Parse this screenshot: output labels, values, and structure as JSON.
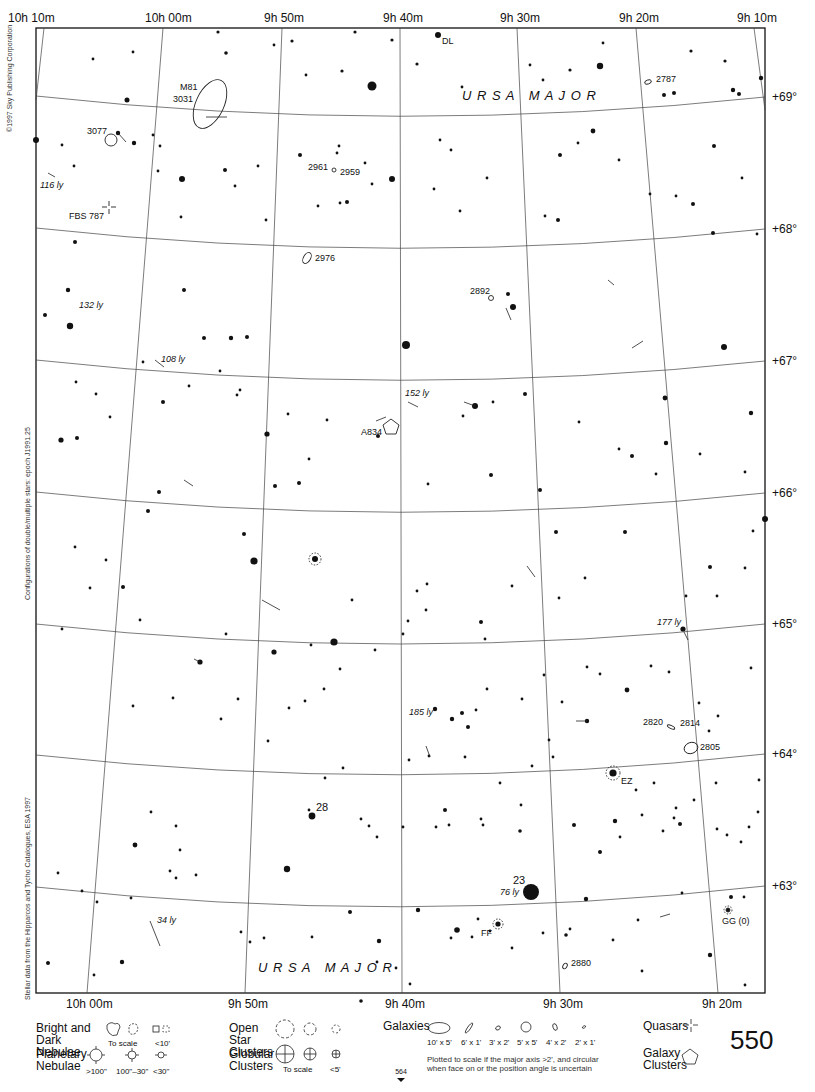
{
  "chart": {
    "constellation_labels": [
      {
        "text": "U R S A   M A J O R",
        "x": 462,
        "y": 100
      },
      {
        "text": "U R S A   M A J O R",
        "x": 258,
        "y": 972
      }
    ],
    "ra_labels_top": [
      {
        "text": "10h 10m",
        "x": 8,
        "y": 22
      },
      {
        "text": "10h 00m",
        "x": 145,
        "y": 22
      },
      {
        "text": "9h 50m",
        "x": 264,
        "y": 22
      },
      {
        "text": "9h 40m",
        "x": 383,
        "y": 22
      },
      {
        "text": "9h 30m",
        "x": 500,
        "y": 22
      },
      {
        "text": "9h 20m",
        "x": 619,
        "y": 22
      },
      {
        "text": "9h 10m",
        "x": 737,
        "y": 22
      }
    ],
    "ra_labels_bottom": [
      {
        "text": "10h 00m",
        "x": 66,
        "y": 1008
      },
      {
        "text": "9h 50m",
        "x": 228,
        "y": 1008
      },
      {
        "text": "9h 40m",
        "x": 385,
        "y": 1008
      },
      {
        "text": "9h 30m",
        "x": 543,
        "y": 1008
      },
      {
        "text": "9h 20m",
        "x": 702,
        "y": 1008
      }
    ],
    "dec_labels": [
      {
        "text": "+69°",
        "x": 772,
        "y": 101
      },
      {
        "text": "+68°",
        "x": 772,
        "y": 233
      },
      {
        "text": "+67°",
        "x": 772,
        "y": 365
      },
      {
        "text": "+66°",
        "x": 772,
        "y": 497
      },
      {
        "text": "+65°",
        "x": 772,
        "y": 628
      },
      {
        "text": "+64°",
        "x": 772,
        "y": 758
      },
      {
        "text": "+63°",
        "x": 772,
        "y": 890
      }
    ],
    "object_labels": [
      {
        "text": "DL",
        "x": 442,
        "y": 44,
        "italic": false
      },
      {
        "text": "M81",
        "x": 180,
        "y": 90,
        "italic": false
      },
      {
        "text": "3031",
        "x": 173,
        "y": 102,
        "italic": false
      },
      {
        "text": "2787",
        "x": 656,
        "y": 82,
        "italic": false
      },
      {
        "text": "3077",
        "x": 87,
        "y": 134,
        "italic": false
      },
      {
        "text": "2961",
        "x": 308,
        "y": 170,
        "italic": false
      },
      {
        "text": "2959",
        "x": 340,
        "y": 175,
        "italic": false
      },
      {
        "text": "116 ly",
        "x": 40,
        "y": 188,
        "italic": true
      },
      {
        "text": "FBS 787",
        "x": 69,
        "y": 219,
        "italic": false
      },
      {
        "text": "2976",
        "x": 315,
        "y": 261,
        "italic": false
      },
      {
        "text": "2892",
        "x": 470,
        "y": 294,
        "italic": false
      },
      {
        "text": "132 ly",
        "x": 79,
        "y": 308,
        "italic": true
      },
      {
        "text": "108 ly",
        "x": 161,
        "y": 362,
        "italic": true
      },
      {
        "text": "152 ly",
        "x": 405,
        "y": 396,
        "italic": true
      },
      {
        "text": "A834",
        "x": 361,
        "y": 435,
        "italic": false
      },
      {
        "text": "177 ly",
        "x": 657,
        "y": 625,
        "italic": true
      },
      {
        "text": "185 ly",
        "x": 409,
        "y": 715,
        "italic": true
      },
      {
        "text": "2820",
        "x": 643,
        "y": 725,
        "italic": false
      },
      {
        "text": "2814",
        "x": 680,
        "y": 726,
        "italic": false
      },
      {
        "text": "2805",
        "x": 700,
        "y": 750,
        "italic": false
      },
      {
        "text": "EZ",
        "x": 621,
        "y": 784,
        "italic": false
      },
      {
        "text": "28",
        "x": 316,
        "y": 811,
        "italic": false
      },
      {
        "text": "23",
        "x": 513,
        "y": 884,
        "italic": false
      },
      {
        "text": "76 ly",
        "x": 500,
        "y": 895,
        "italic": true
      },
      {
        "text": "34 ly",
        "x": 157,
        "y": 923,
        "italic": true
      },
      {
        "text": "FF",
        "x": 481,
        "y": 936,
        "italic": false
      },
      {
        "text": "GG (0)",
        "x": 722,
        "y": 924,
        "italic": false
      },
      {
        "text": "2880",
        "x": 571,
        "y": 966,
        "italic": false
      }
    ],
    "credits": [
      {
        "text": "©1997 Sky Publishing Corporation"
      },
      {
        "text": "Configurations of double/multiple stars: epoch J1991.25"
      },
      {
        "text": "Stellar data from the Hipparcos and Tycho Catalogues, ESA 1997"
      }
    ],
    "page_number": "550",
    "page_ref": "564"
  },
  "legend": {
    "nebulae": {
      "title": "Bright and Dark Nebulae",
      "to_scale": "To scale",
      "small": "<10'"
    },
    "planetary": {
      "title": "Planetary Nebulae",
      "sizes": [
        ">100\"",
        "100\"–30\"",
        "<30\""
      ]
    },
    "open_clusters": {
      "title": "Open Star Clusters"
    },
    "globular": {
      "title": "Globular Clusters",
      "to_scale": "To scale",
      "small": "<5'"
    },
    "galaxies": {
      "title": "Galaxies",
      "sizes": [
        "10' x 5'",
        "6' x 1'",
        "3' x 2'",
        "5' x 5'",
        "4' x 2'",
        "2' x 1'"
      ],
      "note": "Plotted to scale if the major axis >2', and circular when face on or the position angle is uncertain"
    },
    "quasars": {
      "title": "Quasars"
    },
    "galaxy_clusters": {
      "title": "Galaxy Clusters"
    }
  }
}
